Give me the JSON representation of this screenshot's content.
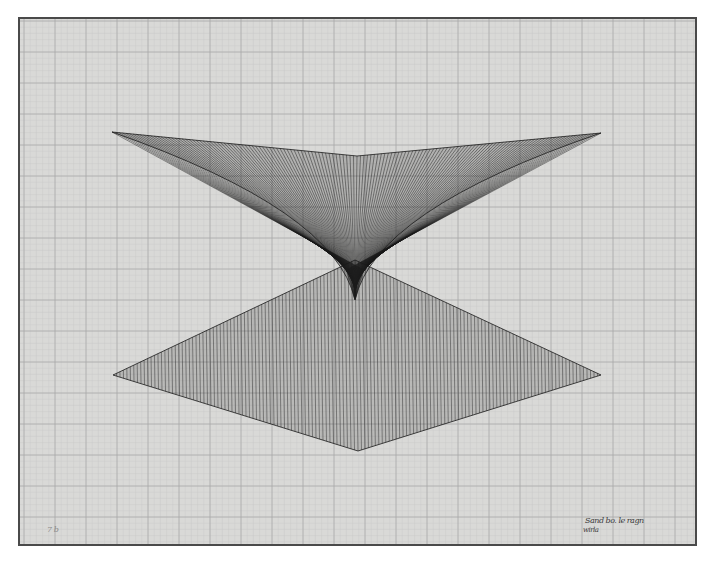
{
  "artwork": {
    "description": "Line drawing on graph paper: an inverted string-art hyperbolic surface above a diamond of converging lines",
    "paper": {
      "x": 19,
      "y": 18,
      "width": 677,
      "height": 527,
      "color": "#d9d9d7",
      "border_color": "#4a4a4a"
    },
    "grid": {
      "major_spacing": 31,
      "minor_spacing": 6.2,
      "major_color": "#a9a9a7",
      "minor_color": "#c9c9c7",
      "origin_x": 24,
      "origin_y": 21
    },
    "line_color": "#1a1a1a",
    "upper_shape": {
      "left_tip": [
        112,
        132
      ],
      "center_top": [
        357,
        156
      ],
      "right_tip": [
        601,
        133
      ],
      "waist_point": [
        355,
        300
      ],
      "line_count": 140
    },
    "lower_shape": {
      "apex": [
        355,
        260
      ],
      "left_tip": [
        113,
        375
      ],
      "bottom_tip": [
        358,
        451
      ],
      "right_tip": [
        601,
        375
      ],
      "line_count": 140
    },
    "signature": {
      "line1": "Sand bo. le ragn",
      "line2": "wirla",
      "x": 585,
      "y": 524
    },
    "corner_mark": {
      "text": "7 b",
      "x": 47,
      "y": 531
    }
  }
}
